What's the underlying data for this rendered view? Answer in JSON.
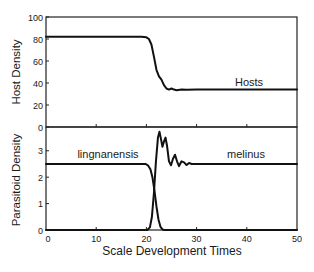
{
  "chart_data": [
    {
      "type": "line",
      "panel": "top",
      "ylabel": "Host Density",
      "xlabel": "",
      "xlim": [
        0,
        50
      ],
      "ylim": [
        0,
        100
      ],
      "yticks": [
        0,
        20,
        40,
        60,
        80,
        100
      ],
      "xticks": [
        0,
        10,
        20,
        30,
        40,
        50
      ],
      "grid": false,
      "series": [
        {
          "name": "Hosts",
          "label_pos": [
            41,
            38
          ],
          "x": [
            0,
            19,
            20,
            20.5,
            21,
            21.5,
            22,
            22.5,
            23,
            23.5,
            24,
            24.5,
            25,
            25.5,
            26,
            27,
            28,
            30,
            35,
            50
          ],
          "y": [
            82,
            82,
            81.5,
            80,
            75,
            64,
            52,
            46,
            43,
            38,
            35,
            34,
            35,
            34,
            33.5,
            34,
            33.8,
            34,
            34,
            34
          ]
        }
      ]
    },
    {
      "type": "line",
      "panel": "bottom",
      "ylabel": "Parasitoid Density",
      "xlabel": "Scale Development Times",
      "xlim": [
        0,
        50
      ],
      "ylim": [
        0,
        3.9
      ],
      "yticks": [
        0,
        1,
        2,
        3
      ],
      "xticks": [
        0,
        10,
        20,
        30,
        40,
        50
      ],
      "xticklabels": [
        "0",
        "10",
        "20",
        "30",
        "40",
        "50"
      ],
      "grid": false,
      "series": [
        {
          "name": "lingnanensis",
          "label_pos": [
            9.5,
            2.8
          ],
          "x": [
            0,
            19.8,
            20.3,
            20.8,
            21.2,
            21.6,
            22,
            22.4,
            22.8,
            23.2,
            23.6,
            50
          ],
          "y": [
            2.5,
            2.5,
            2.45,
            2.3,
            2.0,
            1.5,
            0.9,
            0.4,
            0.12,
            0.02,
            0,
            0
          ]
        },
        {
          "name": "melinus",
          "label_pos": [
            36.5,
            2.8
          ],
          "x": [
            0,
            20.2,
            20.7,
            21.1,
            21.5,
            21.9,
            22.3,
            22.6,
            22.9,
            23.2,
            23.5,
            23.8,
            24.1,
            24.5,
            24.9,
            25.3,
            25.7,
            26.1,
            26.5,
            27,
            27.5,
            28,
            28.5,
            29,
            30,
            35,
            50
          ],
          "y": [
            0,
            0,
            0.1,
            0.5,
            1.4,
            2.6,
            3.5,
            3.72,
            3.45,
            3.15,
            3.35,
            3.5,
            3.2,
            2.6,
            2.45,
            2.7,
            2.85,
            2.6,
            2.42,
            2.6,
            2.56,
            2.46,
            2.54,
            2.5,
            2.5,
            2.5,
            2.5
          ]
        }
      ]
    }
  ],
  "labels": {
    "top_ylabel": "Host Density",
    "bottom_ylabel": "Parasitoid Density",
    "xlabel": "Scale Development Times",
    "hosts": "Hosts",
    "lingnanensis": "lingnanensis",
    "melinus": "melinus"
  },
  "style": {
    "line_color": "#111111",
    "axis_color": "#222222",
    "background": "#ffffff"
  }
}
